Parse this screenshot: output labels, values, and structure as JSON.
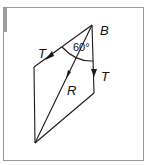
{
  "diagram": {
    "title": "",
    "labels": {
      "point_b": "B",
      "tension_left": "T",
      "tension_right": "T",
      "resultant": "R",
      "angle": "60°"
    },
    "colors": {
      "line": "#1a1a1a",
      "frame": "#9a9a9a",
      "strip": "#9c9c9c",
      "background": "#ffffff"
    }
  }
}
